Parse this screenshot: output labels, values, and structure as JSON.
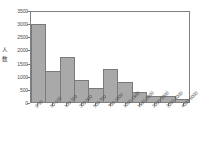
{
  "chart_data": {
    "type": "bar",
    "title": "",
    "subtitle": "",
    "xlabel": "",
    "ylabel": "人数",
    "ylabel_chars": [
      "人",
      "数"
    ],
    "categories": [
      "0-50",
      "50-100",
      "100-300",
      "300-500",
      "500-700",
      "700-1000",
      "1000-1500",
      "1500-2000",
      "2000-3000",
      "3000-4000",
      "4000-5000"
    ],
    "values": [
      2950,
      1180,
      1700,
      830,
      540,
      1250,
      770,
      390,
      230,
      215,
      100
    ],
    "ylim": [
      0,
      3500
    ],
    "y_ticks": [
      0,
      500,
      1000,
      1500,
      2000,
      2500,
      3000,
      3500
    ],
    "y_tick_labels": [
      "0",
      "500",
      "1000",
      "1500",
      "2000",
      "2500",
      "3000",
      "3500"
    ],
    "grid": false,
    "legend": false,
    "legend_position": "none",
    "bar_color": "#a9a9a9",
    "bar_edge_color": "#7a7a7a",
    "axis_color": "#808080",
    "text_color": "#4a4a4a",
    "background_color": "#ffffff"
  }
}
